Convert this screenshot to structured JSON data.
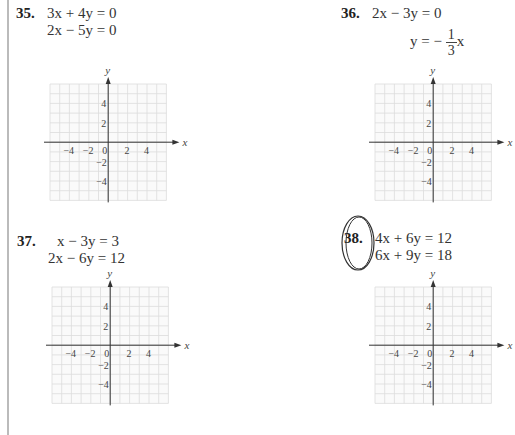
{
  "problems": [
    {
      "number": "35.",
      "equations": [
        "3x + 4y = 0",
        "2x − 5y = 0"
      ]
    },
    {
      "number": "36.",
      "equations": [
        "2x − 3y = 0",
        "y = −",
        "1",
        "3",
        "x"
      ]
    },
    {
      "number": "37.",
      "equations": [
        "x − 3y = 3",
        "2x − 6y = 12"
      ]
    },
    {
      "number": "38.",
      "equations": [
        "4x + 6y = 12",
        "6x + 9y = 18"
      ],
      "circled": true
    }
  ],
  "graph": {
    "x_axis_label": "x",
    "y_axis_label": "y",
    "x_ticks": [
      "−4",
      "−2",
      "0",
      "2",
      "4"
    ],
    "y_ticks": [
      "4",
      "2",
      "−2",
      "−4"
    ],
    "grid_range": [
      -6,
      6
    ]
  },
  "chart_data": [
    {
      "type": "scatter",
      "title": "35",
      "xlabel": "x",
      "ylabel": "y",
      "xlim": [
        -6,
        6
      ],
      "ylim": [
        -6,
        6
      ],
      "grid": true,
      "x_ticks": [
        -4,
        -2,
        0,
        2,
        4
      ],
      "y_ticks": [
        -4,
        -2,
        2,
        4
      ],
      "series": []
    },
    {
      "type": "scatter",
      "title": "36",
      "xlabel": "x",
      "ylabel": "y",
      "xlim": [
        -6,
        6
      ],
      "ylim": [
        -6,
        6
      ],
      "grid": true,
      "x_ticks": [
        -4,
        -2,
        0,
        2,
        4
      ],
      "y_ticks": [
        -4,
        -2,
        2,
        4
      ],
      "series": []
    },
    {
      "type": "scatter",
      "title": "37",
      "xlabel": "x",
      "ylabel": "y",
      "xlim": [
        -6,
        6
      ],
      "ylim": [
        -6,
        6
      ],
      "grid": true,
      "x_ticks": [
        -4,
        -2,
        0,
        2,
        4
      ],
      "y_ticks": [
        -4,
        -2,
        2,
        4
      ],
      "series": []
    },
    {
      "type": "scatter",
      "title": "38",
      "xlabel": "x",
      "ylabel": "y",
      "xlim": [
        -6,
        6
      ],
      "ylim": [
        -6,
        6
      ],
      "grid": true,
      "x_ticks": [
        -4,
        -2,
        0,
        2,
        4
      ],
      "y_ticks": [
        -4,
        -2,
        2,
        4
      ],
      "series": []
    }
  ]
}
